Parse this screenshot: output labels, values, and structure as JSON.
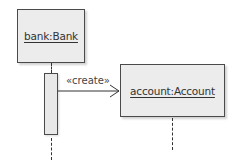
{
  "diagram": {
    "type": "uml-sequence",
    "lifelines": [
      {
        "id": "bank",
        "label": "bank:Bank"
      },
      {
        "id": "account",
        "label": "account:Account"
      }
    ],
    "messages": [
      {
        "from": "bank",
        "to": "account",
        "label": "«create»",
        "kind": "create"
      }
    ],
    "colors": {
      "box_fill": "#ececec",
      "border": "#4a4a4a",
      "text": "#333333"
    }
  }
}
